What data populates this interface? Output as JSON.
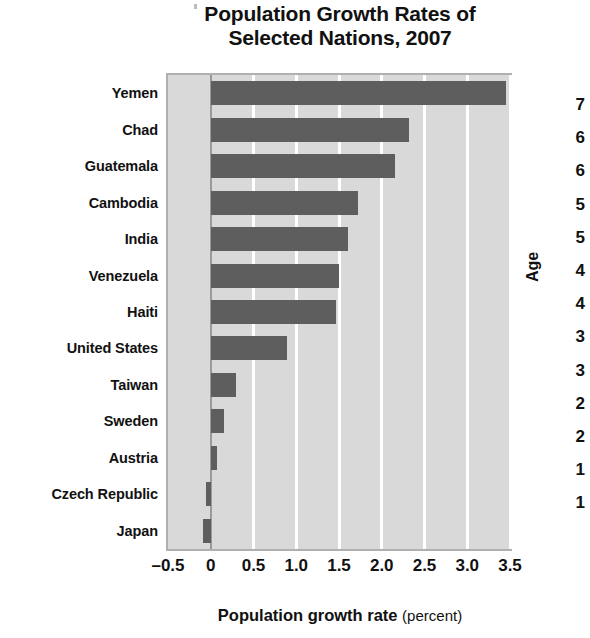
{
  "chart_data": {
    "type": "bar",
    "orientation": "horizontal",
    "title": "Population Growth Rates of Selected Nations, 2007",
    "title_lines": [
      "Population Growth Rates of",
      "Selected Nations, 2007"
    ],
    "xlabel": "Population growth rate",
    "xlabel_unit": "(percent)",
    "ylabel": "",
    "categories": [
      "Yemen",
      "Chad",
      "Guatemala",
      "Cambodia",
      "India",
      "Venezuela",
      "Haiti",
      "United States",
      "Taiwan",
      "Sweden",
      "Austria",
      "Czech Republic",
      "Japan"
    ],
    "values": [
      3.45,
      2.32,
      2.16,
      1.72,
      1.6,
      1.5,
      1.47,
      0.89,
      0.29,
      0.16,
      0.07,
      -0.06,
      -0.09
    ],
    "xlim": [
      -0.5,
      3.5
    ],
    "xticks": [
      -0.5,
      0,
      0.5,
      1.0,
      1.5,
      2.0,
      2.5,
      3.0,
      3.5
    ],
    "xtick_labels": [
      "–0.5",
      "0",
      "0.5",
      "1.0",
      "1.5",
      "2.0",
      "2.5",
      "3.0",
      "3.5"
    ],
    "grid": true,
    "grid_axis": "x",
    "legend": {
      "position": "bottom-right",
      "entries": [
        {
          "label": "LDC",
          "color": "#5e5e5e"
        }
      ]
    },
    "colors": {
      "bar": "#5e5e5e",
      "plot_background": "#d9d9d9",
      "gridline": "#ffffff",
      "zero_line": "#9a9a9a",
      "frame": "#b0b0b0",
      "text": "#111111",
      "page_background": "#ffffff"
    }
  },
  "side_panel": {
    "axis_title": "Age",
    "tick_labels": [
      "7",
      "6",
      "6",
      "5",
      "5",
      "4",
      "4",
      "3",
      "3",
      "2",
      "2",
      "1",
      "1"
    ]
  }
}
